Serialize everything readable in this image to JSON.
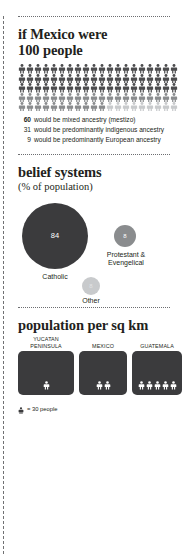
{
  "chart_data": [
    {
      "type": "pictogram",
      "title": "if Mexico were 100 people",
      "unit_label": "1 figure = 1 person",
      "total": 100,
      "columns": 20,
      "rows": 5,
      "categories": [
        "would be mixed ancestry (mestizo)",
        "would be predominantly indigenous ancestry",
        "would be predominantly European ancestry"
      ],
      "values": [
        60,
        31,
        9
      ],
      "colors": [
        "#4c4c4e",
        "#8a8c8e",
        "#c8cacc"
      ],
      "legend": [
        {
          "value": "60",
          "text": "would be mixed ancestry (mestizo)",
          "bold": true
        },
        {
          "value": "31",
          "text": "would be predominantly indigenous ancestry",
          "bold": false
        },
        {
          "value": "9",
          "text": "would be predominantly European ancestry",
          "bold": false
        }
      ]
    },
    {
      "type": "bubble",
      "title": "belief systems",
      "subtitle": "(% of population)",
      "ylabel": "% of population",
      "categories": [
        "Catholic",
        "Protestant & Evengelical",
        "Other"
      ],
      "values": [
        84,
        8,
        8
      ],
      "colors": [
        "#3b3b3d",
        "#8a8c8e",
        "#c8cacc"
      ],
      "labels": [
        "Catholic",
        "Protestant & Evengelical",
        "Other"
      ]
    },
    {
      "type": "pictogram",
      "title": "population per sq km",
      "unit_label": "= 30 people",
      "categories": [
        "YUCATAN PENINSULA",
        "MEXICO",
        "GUATEMALA"
      ],
      "values": [
        1,
        2,
        5
      ],
      "unit_value": 30,
      "colors": [
        "#3b3b3d"
      ]
    }
  ],
  "section1": {
    "title_line1": "if Mexico were",
    "title_line2": "100 people",
    "figures": {
      "total": 100,
      "per_row": 20,
      "groups": [
        {
          "name": "mestizo",
          "count": 60,
          "color": "#4c4c4e"
        },
        {
          "name": "indigenous",
          "count": 31,
          "color": "#8a8c8e"
        },
        {
          "name": "european",
          "count": 9,
          "color": "#c8cacc"
        }
      ]
    },
    "legend": [
      {
        "num": "60",
        "text": "would be mixed ancestry (mestizo)"
      },
      {
        "num": "31",
        "text": "would be predominantly indigenous ancestry"
      },
      {
        "num": "9",
        "text": "would be predominantly European ancestry"
      }
    ]
  },
  "section2": {
    "title": "belief systems",
    "subtitle": "(% of population)",
    "bubbles": [
      {
        "value": "84",
        "label": "Catholic",
        "color": "#3b3b3d"
      },
      {
        "value": "8",
        "label_line1": "Protestant &",
        "label_line2": "Evengelical",
        "color": "#8a8c8e"
      },
      {
        "value": "8",
        "label": "Other",
        "color": "#c8cacc"
      }
    ]
  },
  "section3": {
    "title": "population per sq km",
    "boxes": [
      {
        "caption_line1": "YUCATAN",
        "caption_line2": "PENINSULA",
        "figures": 1,
        "width": 56
      },
      {
        "caption_line1": "MEXICO",
        "caption_line2": "",
        "figures": 2,
        "width": 48
      },
      {
        "caption_line1": "GUATEMALA",
        "caption_line2": "",
        "figures": 5,
        "width": 50
      }
    ],
    "key_text": "= 30 people"
  }
}
